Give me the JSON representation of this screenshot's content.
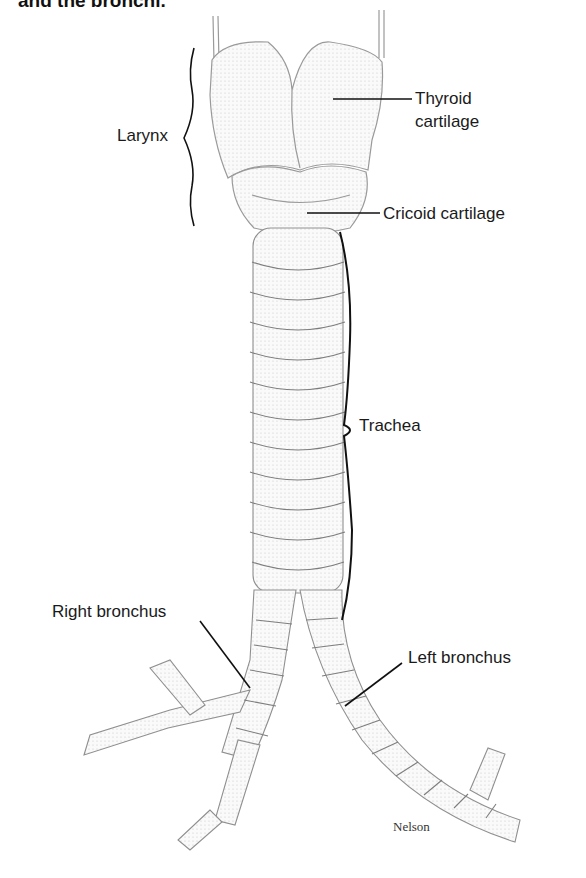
{
  "caption": {
    "top_fragment": "and the bronchi."
  },
  "labels": {
    "larynx": "Larynx",
    "thyroid_line1": "Thyroid",
    "thyroid_line2": "cartilage",
    "cricoid": "Cricoid cartilage",
    "trachea": "Trachea",
    "right_bronchus": "Right bronchus",
    "left_bronchus": "Left bronchus"
  },
  "credit": "Nelson",
  "colors": {
    "ink": "#1a1a1a",
    "sketch": "#9a9a9a",
    "shade": "#d6d6d6",
    "background": "#ffffff"
  }
}
